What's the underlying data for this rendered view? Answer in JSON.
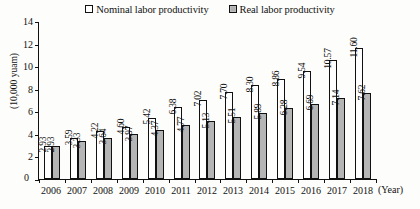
{
  "chart_data": {
    "type": "bar",
    "title": "",
    "xlabel": "(Year)",
    "ylabel": "(10,000 yuam)",
    "ylim": [
      0,
      14
    ],
    "yticks": [
      0,
      2,
      4,
      6,
      8,
      10,
      12,
      14
    ],
    "grid": false,
    "legend_position": "top-center",
    "categories": [
      "2006",
      "2007",
      "2008",
      "2009",
      "2010",
      "2011",
      "2012",
      "2013",
      "2014",
      "2015",
      "2016",
      "2017",
      "2018"
    ],
    "series": [
      {
        "name": "Nominal labor productivity",
        "color": "#ffffff",
        "values": [
          2.93,
          3.59,
          4.22,
          4.6,
          5.42,
          6.38,
          7.02,
          7.7,
          8.3,
          8.86,
          9.54,
          10.57,
          11.6
        ],
        "labels": [
          "2.93",
          "3.59",
          "4.22",
          "4.60",
          "5.42",
          "6.38",
          "7.02",
          "7.70",
          "8.30",
          "8.86",
          "9.54",
          "10.57",
          "11.60"
        ]
      },
      {
        "name": "Real labor productivity",
        "color": "#b5b5b5",
        "values": [
          2.93,
          3.33,
          3.64,
          3.97,
          4.37,
          4.77,
          5.13,
          5.51,
          5.89,
          6.28,
          6.69,
          7.14,
          7.62
        ],
        "labels": [
          "2.93",
          "3.33",
          "3.64",
          "3.97",
          "4.37",
          "4.77",
          "5.13",
          "5.51",
          "5.89",
          "6.28",
          "6.69",
          "7.14",
          "7.62"
        ]
      }
    ]
  },
  "legend": {
    "items": [
      {
        "label": "Nominal labor productivity",
        "swatch": "white-square-icon"
      },
      {
        "label": "Real labor productivity",
        "swatch": "gray-square-icon"
      }
    ]
  },
  "axes": {
    "y_title": "(10,000 yuam)",
    "y_tick_labels": [
      "0",
      "2",
      "4",
      "6",
      "8",
      "10",
      "12",
      "14"
    ],
    "x_unit_label": "(Year)",
    "x_tick_labels": [
      "2006",
      "2007",
      "2008",
      "2009",
      "2010",
      "2011",
      "2012",
      "2013",
      "2014",
      "2015",
      "2016",
      "2017",
      "2018"
    ]
  }
}
